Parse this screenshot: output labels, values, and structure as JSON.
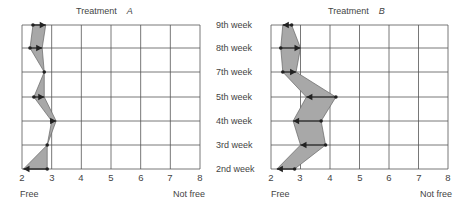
{
  "weeks": [
    "9th week",
    "8th week",
    "7th week",
    "5th week",
    "4th week",
    "3rd week",
    "2nd week"
  ],
  "axis": {
    "ticks": [
      "2",
      "3",
      "4",
      "5",
      "6",
      "7",
      "8"
    ],
    "left_label": "Free",
    "right_label": "Not free"
  },
  "panels": [
    {
      "title": "Treatment",
      "letter": "A"
    },
    {
      "title": "Treatment",
      "letter": "B"
    }
  ],
  "colors": {
    "fill": "#a8a8a8",
    "line": "#222222",
    "grid": "#555555"
  },
  "chart_data": [
    {
      "type": "line",
      "title": "Treatment A",
      "xlabel": "Free → Not free",
      "ylabel": "",
      "xlim": [
        2,
        8
      ],
      "categories": [
        "9th week",
        "8th week",
        "7th week",
        "5th week",
        "4th week",
        "3rd week",
        "2nd week"
      ],
      "series": [
        {
          "name": "start",
          "values": [
            2.37,
            2.27,
            2.75,
            2.4,
            3.0,
            2.85,
            2.85
          ]
        },
        {
          "name": "end (arrow)",
          "values": [
            2.8,
            2.68,
            2.75,
            2.75,
            3.15,
            2.85,
            2.05
          ]
        }
      ],
      "grid": true
    },
    {
      "type": "line",
      "title": "Treatment B",
      "xlabel": "Free → Not free",
      "ylabel": "",
      "xlim": [
        2,
        8
      ],
      "categories": [
        "9th week",
        "8th week",
        "7th week",
        "5th week",
        "4th week",
        "3rd week",
        "2nd week"
      ],
      "series": [
        {
          "name": "start",
          "values": [
            2.7,
            2.33,
            2.4,
            4.2,
            3.7,
            3.85,
            2.8
          ]
        },
        {
          "name": "end (arrow)",
          "values": [
            2.4,
            3.0,
            2.85,
            3.2,
            2.75,
            3.0,
            2.2
          ]
        }
      ],
      "grid": true
    }
  ]
}
